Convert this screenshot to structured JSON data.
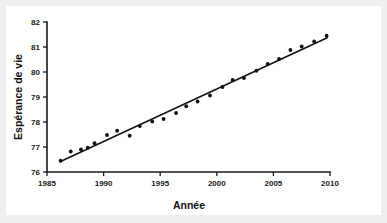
{
  "figure": {
    "background_color": "#efefef",
    "card_color": "#ffffff",
    "ink_color": "#111111"
  },
  "chart_data": {
    "type": "scatter",
    "title": "",
    "xlabel": "Année",
    "ylabel": "Espérance de vie",
    "xlim": [
      1985,
      2010
    ],
    "ylim": [
      76,
      82
    ],
    "grid": false,
    "legend": "none",
    "xticks": [
      1985,
      1990,
      1995,
      2000,
      2005,
      2010
    ],
    "xtick_labels": [
      "1985",
      "1990",
      "1995",
      "2000",
      "2005",
      "2010"
    ],
    "yticks": [
      76,
      77,
      78,
      79,
      80,
      81,
      82
    ],
    "ytick_labels": [
      "76",
      "77",
      "78",
      "79",
      "80",
      "81",
      "82"
    ],
    "points": [
      {
        "x": 1986.2,
        "y": 76.45
      },
      {
        "x": 1987.1,
        "y": 76.82
      },
      {
        "x": 1988.0,
        "y": 76.9
      },
      {
        "x": 1988.6,
        "y": 76.97
      },
      {
        "x": 1989.2,
        "y": 77.15
      },
      {
        "x": 1990.3,
        "y": 77.48
      },
      {
        "x": 1991.2,
        "y": 77.65
      },
      {
        "x": 1992.3,
        "y": 77.45
      },
      {
        "x": 1993.2,
        "y": 77.84
      },
      {
        "x": 1994.3,
        "y": 78.02
      },
      {
        "x": 1995.3,
        "y": 78.12
      },
      {
        "x": 1996.4,
        "y": 78.36
      },
      {
        "x": 1997.3,
        "y": 78.63
      },
      {
        "x": 1998.3,
        "y": 78.82
      },
      {
        "x": 1999.4,
        "y": 79.06
      },
      {
        "x": 2000.5,
        "y": 79.4
      },
      {
        "x": 2001.4,
        "y": 79.68
      },
      {
        "x": 2002.4,
        "y": 79.76
      },
      {
        "x": 2003.5,
        "y": 80.05
      },
      {
        "x": 2004.5,
        "y": 80.32
      },
      {
        "x": 2005.5,
        "y": 80.52
      },
      {
        "x": 2006.5,
        "y": 80.88
      },
      {
        "x": 2007.5,
        "y": 81.02
      },
      {
        "x": 2008.6,
        "y": 81.22
      },
      {
        "x": 2009.7,
        "y": 81.45
      }
    ],
    "regression_line": {
      "x_start": 1986.1,
      "y_start": 76.4,
      "x_end": 2009.8,
      "y_end": 81.38
    },
    "series": [
      {
        "name": "Espérance de vie",
        "x": [
          1986.2,
          1987.1,
          1988.0,
          1988.6,
          1989.2,
          1990.3,
          1991.2,
          1992.3,
          1993.2,
          1994.3,
          1995.3,
          1996.4,
          1997.3,
          1998.3,
          1999.4,
          2000.5,
          2001.4,
          2002.4,
          2003.5,
          2004.5,
          2005.5,
          2006.5,
          2007.5,
          2008.6,
          2009.7
        ],
        "values": [
          76.45,
          76.82,
          76.9,
          76.97,
          77.15,
          77.48,
          77.65,
          77.45,
          77.84,
          78.02,
          78.12,
          78.36,
          78.63,
          78.82,
          79.06,
          79.4,
          79.68,
          79.76,
          80.05,
          80.32,
          80.52,
          80.88,
          81.02,
          81.22,
          81.45
        ]
      }
    ]
  }
}
